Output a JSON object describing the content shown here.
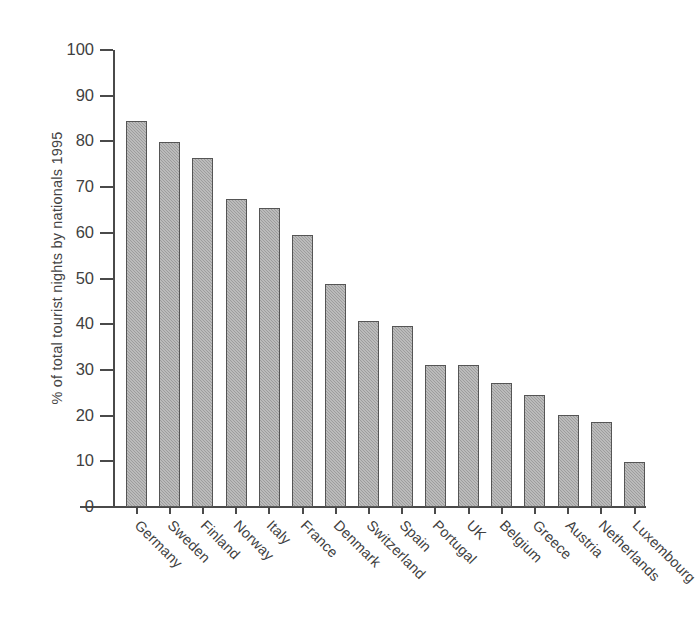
{
  "chart_data": {
    "type": "bar",
    "title": "",
    "subtitle": "",
    "xlabel": "",
    "ylabel": "% of total tourist nights by nationals 1995",
    "ylim": [
      0,
      100
    ],
    "yticks": [
      0,
      10,
      20,
      30,
      40,
      50,
      60,
      70,
      80,
      90,
      100
    ],
    "ytick_labels": [
      "0",
      "10",
      "20",
      "30",
      "40",
      "50",
      "60",
      "70",
      "80",
      "90",
      "100"
    ],
    "grid": false,
    "legend": null,
    "legend_position": "none",
    "categories": [
      "Germany",
      "Sweden",
      "Finland",
      "Norway",
      "Italy",
      "France",
      "Denmark",
      "Switzerland",
      "Spain",
      "Portugal",
      "UK",
      "Belgium",
      "Greece",
      "Austria",
      "Netherlands",
      "Luxembourg"
    ],
    "values": [
      84.5,
      79.8,
      76.3,
      67.5,
      65.5,
      59.5,
      48.8,
      40.8,
      39.7,
      31.0,
      31.0,
      27.2,
      24.5,
      20.2,
      18.6,
      9.8
    ],
    "bar_color": "#9d9d9d",
    "bar_edge_color": "#555555",
    "axis_color": "#4a4a4a",
    "background_color": "#ffffff"
  },
  "axis": {
    "y_title": "% of total tourist nights by nationals 1995"
  }
}
